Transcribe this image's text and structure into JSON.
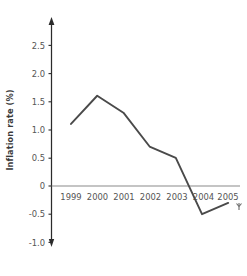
{
  "chart_data": {
    "type": "line",
    "title": "",
    "subtitle": "",
    "xlabel": "",
    "ylabel": "Inflation rate (%)",
    "categories": [
      "1999",
      "2000",
      "2001",
      "2002",
      "2003",
      "2004",
      "2005"
    ],
    "values": [
      1.1,
      1.6,
      1.3,
      0.7,
      0.5,
      -0.5,
      -0.3
    ],
    "series": [
      {
        "name": "Inflation rate",
        "values": [
          1.1,
          1.6,
          1.3,
          0.7,
          0.5,
          -0.5,
          -0.3
        ]
      }
    ],
    "x_tick_labels": [
      "1999",
      "2000",
      "2001",
      "2002",
      "2003",
      "2004",
      "2005"
    ],
    "y_tick_labels": [
      "2.5",
      "2.0",
      "1.5",
      "1.0",
      "0.5",
      "0",
      "-0.5",
      "-1.0"
    ],
    "y_tick_values": [
      2.5,
      2.0,
      1.5,
      1.0,
      0.5,
      0,
      -0.5,
      -1.0
    ],
    "ylim": [
      -1.0,
      2.75
    ],
    "grid": false,
    "legend": false,
    "legend_position": "none",
    "zero_line": true,
    "line_color": "#4a4a4a",
    "axis_color": "#2b2b2b",
    "zero_line_color": "#8a8a8a",
    "background_color": "#ffffff",
    "y_axis_arrow": true,
    "x_axis_arrow": true
  },
  "axes": {
    "y_axis_title": "Inflation rate (%)"
  }
}
